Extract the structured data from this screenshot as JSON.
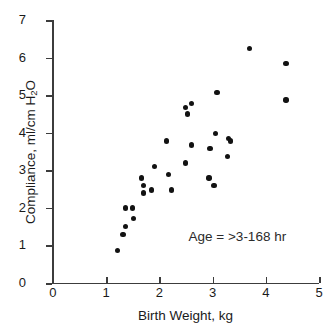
{
  "chart_data": {
    "type": "scatter",
    "title": "",
    "xlabel": "Birth Weight, kg",
    "ylabel": "Compliance, ml/cm H2O",
    "ylabel_parts": {
      "pre": "Compliance, ml/cm H",
      "sub": "2",
      "post": "O"
    },
    "xlim": [
      0,
      5
    ],
    "ylim": [
      0,
      7
    ],
    "xticks": [
      0,
      1,
      2,
      3,
      4,
      5
    ],
    "yticks": [
      0,
      1,
      2,
      3,
      4,
      5,
      6,
      7
    ],
    "xtick_labels": [
      "0",
      "1",
      "2",
      "3",
      "4",
      "5"
    ],
    "ytick_labels": [
      "0",
      "1",
      "2",
      "3",
      "4",
      "5",
      "6",
      "7"
    ],
    "grid": false,
    "legend": null,
    "annotations": [
      {
        "text": "Age = >3-168 hr",
        "x": 2.55,
        "y": 1.2
      }
    ],
    "marker": {
      "shape": "circle",
      "color": "#121212",
      "size": 5.4
    },
    "axis_color": "#3c3c3c",
    "series": [
      {
        "name": "Compliance vs Birth Weight",
        "points": [
          {
            "x": 1.21,
            "y": 0.87
          },
          {
            "x": 1.32,
            "y": 1.3
          },
          {
            "x": 1.37,
            "y": 1.5
          },
          {
            "x": 1.37,
            "y": 2.0
          },
          {
            "x": 1.5,
            "y": 2.0
          },
          {
            "x": 1.52,
            "y": 1.72
          },
          {
            "x": 1.66,
            "y": 2.8
          },
          {
            "x": 1.7,
            "y": 2.6
          },
          {
            "x": 1.7,
            "y": 2.4
          },
          {
            "x": 1.85,
            "y": 2.48
          },
          {
            "x": 1.91,
            "y": 3.1
          },
          {
            "x": 2.14,
            "y": 3.78
          },
          {
            "x": 2.17,
            "y": 2.9
          },
          {
            "x": 2.23,
            "y": 2.48
          },
          {
            "x": 2.49,
            "y": 3.2
          },
          {
            "x": 2.49,
            "y": 4.68
          },
          {
            "x": 2.61,
            "y": 4.78
          },
          {
            "x": 2.53,
            "y": 4.5
          },
          {
            "x": 2.61,
            "y": 3.68
          },
          {
            "x": 2.95,
            "y": 3.58
          },
          {
            "x": 2.93,
            "y": 2.8
          },
          {
            "x": 3.03,
            "y": 2.6
          },
          {
            "x": 3.05,
            "y": 3.98
          },
          {
            "x": 3.08,
            "y": 5.08
          },
          {
            "x": 3.3,
            "y": 3.85
          },
          {
            "x": 3.34,
            "y": 3.78
          },
          {
            "x": 3.28,
            "y": 3.37
          },
          {
            "x": 3.69,
            "y": 6.25
          },
          {
            "x": 4.38,
            "y": 5.85
          },
          {
            "x": 4.38,
            "y": 4.88
          }
        ]
      }
    ]
  }
}
